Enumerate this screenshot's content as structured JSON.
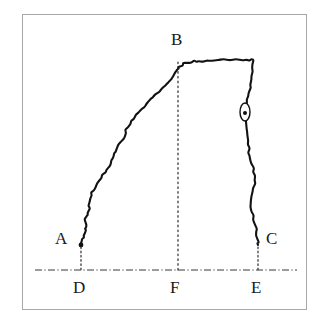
{
  "figure": {
    "title": "",
    "background_color": "#ffffff",
    "frame_color": "#a8a8a8",
    "ink_color": "#121212"
  },
  "labels": {
    "a": "A",
    "b": "B",
    "c": "C",
    "d": "D",
    "e": "E",
    "f": "F"
  },
  "chart_data": {
    "type": "line",
    "title": "",
    "subtitle": "",
    "xlabel": "",
    "ylabel": "",
    "grid": false,
    "legend": null,
    "xlim": [
      22,
      307
    ],
    "ylim": [
      310,
      14
    ],
    "annotations": [
      {
        "name": "A",
        "text": "A",
        "point": [
          81,
          245
        ],
        "label_pos": [
          55,
          230
        ],
        "kind": "curve-endpoint-left"
      },
      {
        "name": "B",
        "text": "B",
        "point": [
          178,
          58
        ],
        "label_pos": [
          171,
          31
        ],
        "kind": "curve-peak"
      },
      {
        "name": "C",
        "text": "C",
        "point": [
          258,
          245
        ],
        "label_pos": [
          266,
          230
        ],
        "kind": "curve-endpoint-right"
      },
      {
        "name": "D",
        "text": "D",
        "point": [
          81,
          270
        ],
        "label_pos": [
          73,
          279
        ],
        "kind": "axis-foot-left"
      },
      {
        "name": "F",
        "text": "F",
        "point": [
          178,
          270
        ],
        "label_pos": [
          170,
          279
        ],
        "kind": "axis-foot-mid"
      },
      {
        "name": "E",
        "text": "E",
        "point": [
          258,
          270
        ],
        "label_pos": [
          251,
          279
        ],
        "kind": "axis-foot-right"
      }
    ],
    "baseline": {
      "y": 270,
      "x_start": 35,
      "x_end": 297,
      "style": "dash-dot"
    },
    "droplines": [
      {
        "from": "A",
        "x": 81,
        "y_top": 247,
        "y_bottom": 270,
        "style": "dotted"
      },
      {
        "from": "B",
        "x": 178,
        "y_top": 62,
        "y_bottom": 270,
        "style": "dotted"
      },
      {
        "from": "C",
        "x": 258,
        "y_top": 247,
        "y_bottom": 270,
        "style": "dotted"
      }
    ],
    "marker": {
      "name": "oval-marker",
      "cx": 245,
      "cy": 112,
      "rx": 5,
      "ry": 9,
      "dot_r": 2
    },
    "series": [
      {
        "name": "hand-drawn-contour",
        "x": [
          81,
          81,
          82,
          82,
          83,
          83,
          84,
          85,
          85,
          86,
          86,
          86,
          85,
          85,
          86,
          87,
          88,
          89,
          89,
          89,
          89,
          90,
          91,
          92,
          93,
          95,
          97,
          99,
          101,
          103,
          105,
          107,
          109,
          110,
          112,
          113,
          114,
          115,
          117,
          119,
          121,
          123,
          124,
          125,
          126,
          128,
          130,
          132,
          134,
          136,
          138,
          141,
          144,
          147,
          150,
          153,
          156,
          159,
          162,
          165,
          168,
          171,
          173,
          175,
          176,
          177,
          178,
          179,
          180,
          182,
          184,
          186,
          188,
          190,
          192,
          194,
          196,
          199,
          203,
          207,
          212,
          218,
          224,
          230,
          236,
          242,
          247,
          250,
          252,
          253,
          253,
          253,
          252,
          252,
          252,
          251,
          250,
          249,
          248,
          247,
          246,
          245,
          245,
          245,
          245,
          246,
          246,
          247,
          247,
          248,
          248,
          249,
          249,
          250,
          251,
          252,
          253,
          254,
          255,
          255,
          255,
          254,
          253,
          252,
          251,
          251,
          251,
          252,
          253,
          254,
          255,
          256,
          257,
          257,
          258,
          258,
          258,
          258
        ],
        "y": [
          245,
          243,
          241,
          239,
          237,
          235,
          233,
          231,
          229,
          227,
          225,
          223,
          221,
          219,
          217,
          215,
          213,
          211,
          208,
          205,
          202,
          199,
          196,
          193,
          190,
          187,
          184,
          181,
          178,
          175,
          172,
          169,
          166,
          163,
          160,
          157,
          154,
          151,
          148,
          145,
          142,
          139,
          136,
          133,
          130,
          127,
          124,
          121,
          118,
          115,
          112,
          109,
          106,
          103,
          100,
          97,
          94,
          91,
          88,
          85,
          82,
          79,
          76,
          73,
          71,
          69,
          68,
          67,
          66,
          65,
          64,
          63,
          63,
          62,
          62,
          61,
          61,
          61,
          61,
          61,
          61,
          60,
          60,
          60,
          60,
          60,
          60,
          60,
          60,
          60,
          64,
          68,
          72,
          76,
          80,
          84,
          88,
          92,
          96,
          100,
          104,
          108,
          112,
          116,
          120,
          124,
          128,
          132,
          136,
          140,
          144,
          148,
          152,
          156,
          160,
          164,
          168,
          172,
          176,
          180,
          184,
          188,
          192,
          196,
          200,
          204,
          208,
          212,
          216,
          220,
          224,
          228,
          232,
          236,
          239,
          242,
          244,
          245
        ],
        "note": "closed contour traced from A up the left flank, across the top plateau through peak B, down the steep right flank to C"
      }
    ]
  }
}
